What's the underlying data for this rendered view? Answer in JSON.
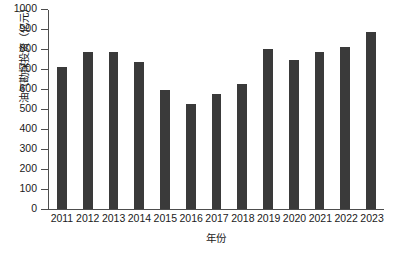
{
  "chart_data": {
    "type": "bar",
    "title": "",
    "xlabel": "年份",
    "ylabel": "油气勘探投资（亿元）",
    "categories": [
      "2011",
      "2012",
      "2013",
      "2014",
      "2015",
      "2016",
      "2017",
      "2018",
      "2019",
      "2020",
      "2021",
      "2022",
      "2023"
    ],
    "values": [
      712,
      788,
      788,
      740,
      598,
      528,
      578,
      628,
      802,
      748,
      788,
      812,
      890
    ],
    "series": [
      {
        "name": "油气勘探投资",
        "values": [
          712,
          788,
          788,
          740,
          598,
          528,
          578,
          628,
          802,
          748,
          788,
          812,
          890
        ]
      }
    ],
    "ylim": [
      0,
      1000
    ],
    "yticks": [
      0,
      100,
      200,
      300,
      400,
      500,
      600,
      700,
      800,
      900,
      1000
    ],
    "ytick_labels": [
      "0",
      "100",
      "200",
      "300",
      "400",
      "500",
      "600",
      "700",
      "800",
      "900",
      "1000"
    ],
    "grid": false,
    "legend": false,
    "legend_position": "none",
    "bar_color": "#3a3a3a",
    "axis_color": "#4d4d4d",
    "background_color": "#ffffff",
    "tick_direction": "out"
  }
}
